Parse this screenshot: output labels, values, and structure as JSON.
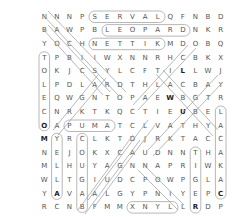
{
  "puzzle": {
    "rows": [
      [
        "N",
        "N",
        "N",
        "P",
        "S",
        "E",
        "R",
        "V",
        "A",
        "L",
        "Q",
        "F",
        "N",
        "B",
        "D"
      ],
      [
        "B",
        "A",
        "W",
        "P",
        "B",
        "L",
        "E",
        "O",
        "P",
        "A",
        "R",
        "D",
        "N",
        "K",
        "R"
      ],
      [
        "Y",
        "O",
        "C",
        "H",
        "N",
        "E",
        "T",
        "T",
        "I",
        "K",
        "M",
        "D",
        "O",
        "B",
        "Q"
      ],
      [
        "T",
        "P",
        "B",
        "I",
        "I",
        "W",
        "X",
        "N",
        "N",
        "R",
        "H",
        "C",
        "B",
        "K",
        "X"
      ],
      [
        "O",
        "K",
        "J",
        "C",
        "S",
        "Y",
        "L",
        "C",
        "F",
        "T",
        "I",
        "L",
        "L",
        "W",
        "J"
      ],
      [
        "L",
        "P",
        "D",
        "L",
        "A",
        "R",
        "D",
        "T",
        "H",
        "L",
        "A",
        "C",
        "B",
        "A",
        "Y"
      ],
      [
        "E",
        "Q",
        "W",
        "G",
        "N",
        "T",
        "O",
        "P",
        "A",
        "E",
        "W",
        "B",
        "G",
        "T",
        "R"
      ],
      [
        "C",
        "N",
        "R",
        "K",
        "T",
        "K",
        "Q",
        "C",
        "T",
        "I",
        "E",
        "U",
        "B",
        "E",
        "L"
      ],
      [
        "O",
        "A",
        "P",
        "U",
        "M",
        "A",
        "T",
        "C",
        "L",
        "V",
        "A",
        "T",
        "H",
        "Y",
        "A"
      ],
      [
        "M",
        "Y",
        "R",
        "C",
        "L",
        "K",
        "T",
        "D",
        "J",
        "R",
        "K",
        "T",
        "A",
        "C",
        "C"
      ],
      [
        "N",
        "E",
        "J",
        "O",
        "K",
        "X",
        "C",
        "A",
        "U",
        "D",
        "N",
        "N",
        "T",
        "H",
        "A"
      ],
      [
        "M",
        "L",
        "H",
        "U",
        "Y",
        "A",
        "G",
        "N",
        "N",
        "A",
        "P",
        "R",
        "I",
        "W",
        "K"
      ],
      [
        "W",
        "L",
        "T",
        "G",
        "I",
        "U",
        "D",
        "C",
        "P",
        "O",
        "W",
        "P",
        "G",
        "L",
        "A"
      ],
      [
        "Y",
        "A",
        "V",
        "A",
        "A",
        "L",
        "G",
        "Y",
        "P",
        "N",
        "I",
        "Y",
        "E",
        "P",
        "C"
      ],
      [
        "R",
        "C",
        "N",
        "B",
        "F",
        "M",
        "M",
        "X",
        "N",
        "Y",
        "L",
        "L",
        "R",
        "D",
        "P"
      ]
    ],
    "found_words": [
      "SERVAL",
      "LEOPARD",
      "KITTEN",
      "PUMA",
      "OCELOT",
      "LYNX",
      "TIGER",
      "CALICO",
      "CARACAL"
    ]
  }
}
